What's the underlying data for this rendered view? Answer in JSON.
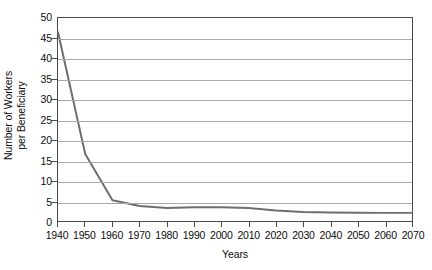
{
  "chart_data": {
    "type": "line",
    "title": "",
    "xlabel": "Years",
    "ylabel_line1": "Number of Workers",
    "ylabel_line2": "per Beneficiary",
    "ylabel": "Number of Workers per Beneficiary",
    "x": [
      1940,
      1950,
      1960,
      1970,
      1980,
      1990,
      2000,
      2010,
      2020,
      2030,
      2040,
      2050,
      2060,
      2070
    ],
    "values": [
      46.5,
      16.5,
      5.1,
      3.7,
      3.2,
      3.4,
      3.4,
      3.2,
      2.6,
      2.2,
      2.1,
      2.05,
      2.0,
      2.0
    ],
    "series": [
      {
        "name": "Workers per Beneficiary",
        "values": [
          46.5,
          16.5,
          5.1,
          3.7,
          3.2,
          3.4,
          3.4,
          3.2,
          2.6,
          2.2,
          2.1,
          2.05,
          2.0,
          2.0
        ]
      }
    ],
    "xlim": [
      1940,
      2070
    ],
    "ylim": [
      0,
      50
    ],
    "ytick_values": [
      0,
      5,
      10,
      15,
      20,
      25,
      30,
      35,
      40,
      45,
      50
    ],
    "ytick_labels": [
      "0",
      "5",
      "10",
      "15",
      "20",
      "25",
      "30",
      "35",
      "40",
      "45",
      "50"
    ],
    "xtick_values": [
      1940,
      1950,
      1960,
      1970,
      1980,
      1990,
      2000,
      2010,
      2020,
      2030,
      2040,
      2050,
      2060,
      2070
    ],
    "xtick_labels": [
      "1940",
      "1950",
      "1960",
      "1970",
      "1980",
      "1990",
      "2000",
      "2010",
      "2020",
      "2030",
      "2040",
      "2050",
      "2060",
      "2070"
    ],
    "grid": "horizontal",
    "legend": "none",
    "line_color": "#6e6e6e",
    "grid_color": "#a9a9a9",
    "axis_color": "#4a4a4a",
    "text_color": "#0d0d0d",
    "background_color": "#ffffff"
  }
}
